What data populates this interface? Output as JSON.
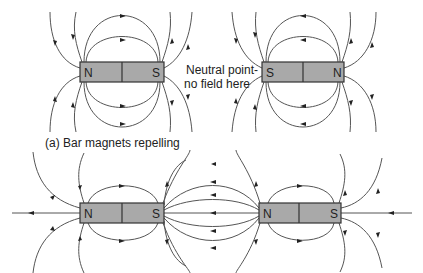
{
  "figure": {
    "caption_a": "(a) Bar magnets repelling",
    "neutral_point_line1": "Neutral point-",
    "neutral_point_line2": "no field here"
  },
  "magnets": {
    "top_left": {
      "left_pole": "N",
      "right_pole": "S"
    },
    "top_right": {
      "left_pole": "S",
      "right_pole": "N"
    },
    "bottom_left": {
      "left_pole": "N",
      "right_pole": "S"
    },
    "bottom_right": {
      "left_pole": "N",
      "right_pole": "S"
    }
  },
  "colors": {
    "magnet_fill": "#a9a9a9",
    "field_line": "#555555",
    "outline": "#333333"
  }
}
